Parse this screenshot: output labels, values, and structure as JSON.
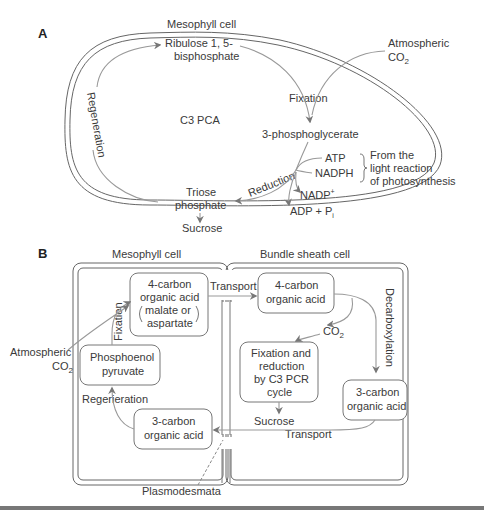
{
  "panel_a": {
    "label": "A",
    "cell_label": "Mesophyll cell",
    "ribulose": [
      "Ribulose 1, 5-",
      "bisphosphate"
    ],
    "atmospheric": [
      "Atmospheric",
      "CO",
      "2"
    ],
    "fixation": "Fixation",
    "c3pca": "C3 PCA",
    "regeneration": "Regeneration",
    "pga": "3-phosphoglycerate",
    "atp": "ATP",
    "nadph": "NADPH",
    "light": [
      "From the",
      "light reaction",
      "of photosynthesis"
    ],
    "reduction": "Reduction",
    "nadp": "NADP",
    "nadp_sup": "+",
    "adp": "ADP + P",
    "adp_sub": "i",
    "triose": [
      "Triose",
      "phosphate"
    ],
    "sucrose": "Sucrose"
  },
  "panel_b": {
    "label": "B",
    "mesophyll_label": "Mesophyll cell",
    "bundle_label": "Bundle sheath cell",
    "meso_4c": [
      "4-carbon",
      "organic acid",
      "malate or",
      "aspartate"
    ],
    "transport_top": "Transport",
    "bundle_4c": [
      "4-carbon",
      "organic acid"
    ],
    "decarboxylation": "Decarboxylation",
    "co2": "CO",
    "co2_sub": "2",
    "fixation": "Fixation",
    "atmospheric": [
      "Atmospheric",
      "CO",
      "2"
    ],
    "pep": [
      "Phosphoenol",
      "pyruvate"
    ],
    "pcr": [
      "Fixation and",
      "reduction",
      "by C3 PCR",
      "cycle"
    ],
    "bundle_3c": [
      "3-carbon",
      "organic acid"
    ],
    "regeneration": "Regerieration",
    "meso_3c": [
      "3-carbon",
      "organic acid"
    ],
    "sucrose": "Sucrose",
    "transport_bottom": "Transport",
    "plasmodesmata": "Plasmodesmata"
  }
}
